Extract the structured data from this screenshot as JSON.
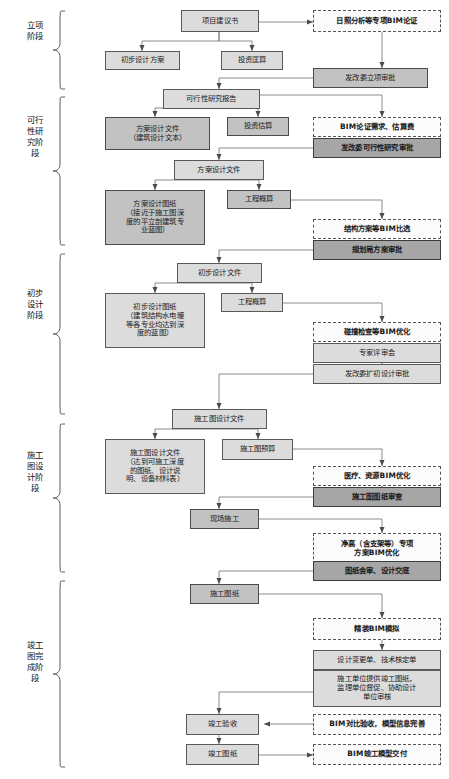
{
  "stages": [
    {
      "id": "stage-lixiang",
      "label": "立项阶段"
    },
    {
      "id": "stage-kexingxing",
      "label": "可行性研究阶段"
    },
    {
      "id": "stage-chubu",
      "label": "初步设计阶段"
    },
    {
      "id": "stage-shigongtu",
      "label": "施工图设计阶段"
    },
    {
      "id": "stage-jungong",
      "label": "竣工图完成阶段"
    }
  ],
  "nodes": [
    {
      "id": "xiangmu-jianyishu",
      "text": "项目建议书",
      "style": "light"
    },
    {
      "id": "richao-bim-lunzheng",
      "text": "日照分析等专项BIM论证",
      "style": "dash"
    },
    {
      "id": "chubu-sheji-fangan",
      "text": "初步设计方案",
      "style": "light"
    },
    {
      "id": "touzi-guangsuan",
      "text": "投资匡算",
      "style": "light"
    },
    {
      "id": "fagaiwei-lixiang-shenpi",
      "text": "发改委立项审批",
      "style": "mid"
    },
    {
      "id": "kexingxing-yanjiu-baogao",
      "text": "可行性研究报告",
      "style": "light"
    },
    {
      "id": "fangan-sheji-wenjian-1",
      "text": "方案设计文件\n（建筑设计文本）",
      "style": "mid"
    },
    {
      "id": "touzi-gusuan",
      "text": "投资估算",
      "style": "mid"
    },
    {
      "id": "bim-lunzheng-xuqiu",
      "text": "BIM论证需求、估算费",
      "style": "dash"
    },
    {
      "id": "fagaiwei-kexingxing-shenpi",
      "text": "发改委可行性研究审批",
      "style": "dark"
    },
    {
      "id": "fangan-sheji-wenjian-2",
      "text": "方案设计文件",
      "style": "light"
    },
    {
      "id": "fangan-sheji-tuzhi",
      "text": "方案设计图纸\n（接近于施工图深\n度的平立剖建筑专\n业蓝图）",
      "style": "mid"
    },
    {
      "id": "gongcheng-gaisuan-1",
      "text": "工程概算",
      "style": "mid"
    },
    {
      "id": "jiegou-fangan-bim-bixuan",
      "text": "结构方案等BIM比选",
      "style": "dash"
    },
    {
      "id": "guihuaju-fangan-shenpi",
      "text": "规划局方案审批",
      "style": "dark"
    },
    {
      "id": "chubu-sheji-wenjian",
      "text": "初步设计文件",
      "style": "light"
    },
    {
      "id": "chubu-sheji-tuzhi",
      "text": "初步设计图纸\n（建筑结构水电暖\n等各专业均达到深\n度的蓝图）",
      "style": "light"
    },
    {
      "id": "gongcheng-gaisuan-2",
      "text": "工程概算",
      "style": "light"
    },
    {
      "id": "pengzhuang-jiancha-bim",
      "text": "碰撞检查等BIM优化",
      "style": "dash"
    },
    {
      "id": "zhuanjia-pingshenhui",
      "text": "专家评审会",
      "style": "light"
    },
    {
      "id": "fagaiwei-kuochu-shenpi",
      "text": "发改委扩初设计审批",
      "style": "light"
    },
    {
      "id": "shigongtu-sheji-wenjian-1",
      "text": "施工图设计文件",
      "style": "light"
    },
    {
      "id": "shigongtu-sheji-wenjian-2",
      "text": "施工图设计文件\n（达到可施工深度\n的图纸、设计说\n明、设备材料表）",
      "style": "light"
    },
    {
      "id": "shigongtu-yusuan",
      "text": "施工图预算",
      "style": "light"
    },
    {
      "id": "yiliao-ziyuan-bim",
      "text": "医疗、资源BIM优化",
      "style": "dash"
    },
    {
      "id": "shigongtu-tuzhi-shencha",
      "text": "施工图图纸审查",
      "style": "dark"
    },
    {
      "id": "xianchang-shigong",
      "text": "现场施工",
      "style": "mid"
    },
    {
      "id": "jinggao-zhuanxiang-bim",
      "text": "净高（含支架等）专项\n方案BIM优化",
      "style": "dash"
    },
    {
      "id": "tuzhi-huishen-jiaodi",
      "text": "图纸会审、设计交底",
      "style": "dark"
    },
    {
      "id": "shigong-tuzhi",
      "text": "施工图纸",
      "style": "mid"
    },
    {
      "id": "jingzhuang-bim-moni",
      "text": "精装BIM模拟",
      "style": "dash"
    },
    {
      "id": "sheji-biangengdan",
      "text": "设计变更单、技术核定单",
      "style": "light"
    },
    {
      "id": "shigong-danwei-tigong",
      "text": "施工单位提供竣工图纸，\n监理单位督促、协助设计\n单位审核",
      "style": "light"
    },
    {
      "id": "jungong-yanshou",
      "text": "竣工验收",
      "style": "light"
    },
    {
      "id": "bim-duibi-yanshou",
      "text": "BIM对比验收，模型信息完善",
      "style": "dash"
    },
    {
      "id": "jungong-tuzhi",
      "text": "竣工图纸",
      "style": "light"
    },
    {
      "id": "bim-jungong-moxing",
      "text": "BIM竣工模型交付",
      "style": "dash"
    }
  ],
  "colors": {
    "light_fill": "#dcdcdc",
    "mid_fill": "#c2c2c2",
    "dark_fill": "#a6a6a6",
    "dash_fill": "#fbfbfb",
    "line": "#6e6e6e",
    "text": "#1a1a1a"
  }
}
